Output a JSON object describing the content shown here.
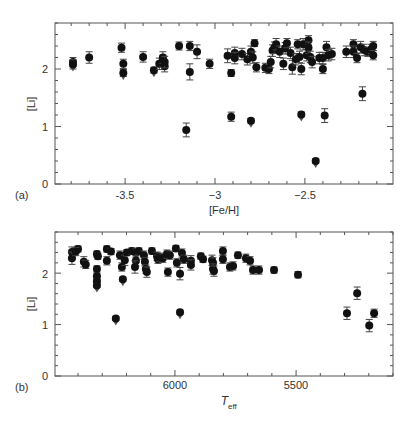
{
  "figure": {
    "panels": [
      {
        "label": "(a)",
        "xlabel": "[Fe/H]",
        "ylabel": "[Li]"
      },
      {
        "label": "(b)",
        "xlabel_main": "T",
        "xlabel_sub": "eff",
        "ylabel": "[Li]"
      }
    ]
  },
  "chart_data": [
    {
      "type": "scatter",
      "panel": "(a)",
      "title": "",
      "xlabel": "[Fe/H]",
      "ylabel": "[Li]",
      "xlim": [
        -3.89,
        -2.01
      ],
      "ylim": [
        0,
        2.8
      ],
      "xticks": [
        -3.5,
        -3,
        -2.5
      ],
      "xtick_labels": [
        "-3.5",
        "−3",
        "−2.5"
      ],
      "yticks": [
        0,
        1,
        2
      ],
      "ytick_labels": [
        "0",
        "1",
        "2"
      ],
      "grid": false,
      "legend": null,
      "marker": "filled-circle-with-errorbars",
      "upper_limit_marker": "downward-arrow",
      "points": [
        {
          "x": -3.79,
          "y": 2.12,
          "err": 0.08
        },
        {
          "x": -3.79,
          "y": 2.08,
          "err": 0.08,
          "upper_limit": true
        },
        {
          "x": -3.7,
          "y": 2.2,
          "err": 0.1
        },
        {
          "x": -3.52,
          "y": 2.37,
          "err": 0.08
        },
        {
          "x": -3.51,
          "y": 2.09,
          "err": 0.08
        },
        {
          "x": -3.51,
          "y": 1.93,
          "err": 0.06,
          "upper_limit": true
        },
        {
          "x": -3.4,
          "y": 2.21,
          "err": 0.09
        },
        {
          "x": -3.34,
          "y": 1.98,
          "err": 0.05,
          "upper_limit": true
        },
        {
          "x": -3.31,
          "y": 2.09,
          "err": 0.1
        },
        {
          "x": -3.29,
          "y": 2.14,
          "err": 0.1
        },
        {
          "x": -3.29,
          "y": 2.2,
          "err": 0.1
        },
        {
          "x": -3.28,
          "y": 2.05,
          "err": 0.1
        },
        {
          "x": -3.28,
          "y": 2.12,
          "err": 0.1
        },
        {
          "x": -3.2,
          "y": 2.4,
          "err": 0.07
        },
        {
          "x": -3.14,
          "y": 2.4,
          "err": 0.08
        },
        {
          "x": -3.14,
          "y": 1.95,
          "err": 0.14
        },
        {
          "x": -3.1,
          "y": 2.3,
          "err": 0.12
        },
        {
          "x": -3.16,
          "y": 0.94,
          "err": 0.12
        },
        {
          "x": -3.03,
          "y": 2.09,
          "err": 0.08
        },
        {
          "x": -2.93,
          "y": 2.23,
          "err": 0.12
        },
        {
          "x": -2.91,
          "y": 1.93,
          "err": 0.06
        },
        {
          "x": -2.89,
          "y": 2.28,
          "err": 0.1
        },
        {
          "x": -2.89,
          "y": 2.19,
          "err": 0.1
        },
        {
          "x": -2.85,
          "y": 2.26,
          "err": 0.1
        },
        {
          "x": -2.82,
          "y": 2.17,
          "err": 0.1
        },
        {
          "x": -2.8,
          "y": 2.3,
          "err": 0.1
        },
        {
          "x": -2.79,
          "y": 2.2,
          "err": 0.1
        },
        {
          "x": -2.78,
          "y": 2.45,
          "err": 0.06
        },
        {
          "x": -2.77,
          "y": 2.03,
          "err": 0.08
        },
        {
          "x": -2.72,
          "y": 2.02,
          "err": 0.08
        },
        {
          "x": -2.7,
          "y": 2.0,
          "err": 0.08
        },
        {
          "x": -2.69,
          "y": 2.12,
          "err": 0.1
        },
        {
          "x": -2.68,
          "y": 2.32,
          "err": 0.1
        },
        {
          "x": -2.67,
          "y": 2.37,
          "err": 0.1
        },
        {
          "x": -2.66,
          "y": 2.43,
          "err": 0.1
        },
        {
          "x": -2.64,
          "y": 2.3,
          "err": 0.1
        },
        {
          "x": -2.62,
          "y": 2.09,
          "err": 0.1
        },
        {
          "x": -2.61,
          "y": 2.36,
          "err": 0.1
        },
        {
          "x": -2.6,
          "y": 2.45,
          "err": 0.08
        },
        {
          "x": -2.58,
          "y": 2.28,
          "err": 0.1
        },
        {
          "x": -2.57,
          "y": 2.03,
          "err": 0.12
        },
        {
          "x": -2.55,
          "y": 2.17,
          "err": 0.1
        },
        {
          "x": -2.54,
          "y": 2.43,
          "err": 0.08
        },
        {
          "x": -2.53,
          "y": 2.21,
          "err": 0.1
        },
        {
          "x": -2.52,
          "y": 2.0,
          "err": 0.1
        },
        {
          "x": -2.51,
          "y": 2.43,
          "err": 0.1
        },
        {
          "x": -2.49,
          "y": 2.24,
          "err": 0.1
        },
        {
          "x": -2.48,
          "y": 2.5,
          "err": 0.08
        },
        {
          "x": -2.48,
          "y": 2.37,
          "err": 0.1
        },
        {
          "x": -2.47,
          "y": 2.21,
          "err": 0.1
        },
        {
          "x": -2.46,
          "y": 2.12,
          "err": 0.1
        },
        {
          "x": -2.42,
          "y": 2.19,
          "err": 0.1
        },
        {
          "x": -2.4,
          "y": 2.19,
          "err": 0.1
        },
        {
          "x": -2.4,
          "y": 2.0,
          "err": 0.08
        },
        {
          "x": -2.38,
          "y": 2.38,
          "err": 0.1
        },
        {
          "x": -2.37,
          "y": 2.24,
          "err": 0.1
        },
        {
          "x": -2.35,
          "y": 2.26,
          "err": 0.1
        },
        {
          "x": -2.27,
          "y": 2.3,
          "err": 0.1
        },
        {
          "x": -2.23,
          "y": 2.43,
          "err": 0.08
        },
        {
          "x": -2.23,
          "y": 2.3,
          "err": 0.1
        },
        {
          "x": -2.21,
          "y": 2.19,
          "err": 0.08
        },
        {
          "x": -2.19,
          "y": 2.38,
          "err": 0.1
        },
        {
          "x": -2.17,
          "y": 2.33,
          "err": 0.1
        },
        {
          "x": -2.15,
          "y": 2.3,
          "err": 0.08
        },
        {
          "x": -2.13,
          "y": 2.35,
          "err": 0.08
        },
        {
          "x": -2.12,
          "y": 2.4,
          "err": 0.08
        },
        {
          "x": -2.12,
          "y": 2.24,
          "err": 0.08
        },
        {
          "x": -2.91,
          "y": 1.17,
          "err": 0.08
        },
        {
          "x": -2.8,
          "y": 1.1,
          "err": 0.04,
          "upper_limit": true
        },
        {
          "x": -2.52,
          "y": 1.21,
          "err": 0.04,
          "upper_limit": true
        },
        {
          "x": -2.39,
          "y": 1.19,
          "err": 0.12
        },
        {
          "x": -2.44,
          "y": 0.4,
          "err": 0.04,
          "upper_limit": true
        },
        {
          "x": -2.18,
          "y": 1.57,
          "err": 0.12
        }
      ]
    },
    {
      "type": "scatter",
      "panel": "(b)",
      "title": "",
      "xlabel": "T_eff",
      "ylabel": "[Li]",
      "xlim": [
        6495,
        5100
      ],
      "ylim": [
        0,
        2.8
      ],
      "xticks": [
        6000,
        5500
      ],
      "xtick_labels": [
        "6000",
        "5500"
      ],
      "yticks": [
        0,
        1,
        2
      ],
      "ytick_labels": [
        "0",
        "1",
        "2"
      ],
      "grid": false,
      "legend": null,
      "marker": "filled-circle-with-errorbars",
      "upper_limit_marker": "downward-arrow",
      "points": [
        {
          "x": 6425,
          "y": 2.41,
          "err": 0.1
        },
        {
          "x": 6425,
          "y": 2.29,
          "err": 0.12
        },
        {
          "x": 6400,
          "y": 2.47,
          "err": 0.06
        },
        {
          "x": 6409,
          "y": 2.42,
          "err": 0.08
        },
        {
          "x": 6376,
          "y": 2.22,
          "err": 0.1
        },
        {
          "x": 6368,
          "y": 2.17,
          "err": 0.08
        },
        {
          "x": 6322,
          "y": 2.37,
          "err": 0.06
        },
        {
          "x": 6318,
          "y": 2.33,
          "err": 0.06
        },
        {
          "x": 6322,
          "y": 2.08,
          "err": 0.06
        },
        {
          "x": 6322,
          "y": 1.94,
          "err": 0.06
        },
        {
          "x": 6322,
          "y": 1.84,
          "err": 0.06
        },
        {
          "x": 6322,
          "y": 1.76,
          "err": 0.04,
          "upper_limit": true
        },
        {
          "x": 6281,
          "y": 2.24,
          "err": 0.08
        },
        {
          "x": 6281,
          "y": 2.47,
          "err": 0.06
        },
        {
          "x": 6264,
          "y": 2.42,
          "err": 0.06
        },
        {
          "x": 6244,
          "y": 1.12,
          "err": 0.04,
          "upper_limit": true
        },
        {
          "x": 6227,
          "y": 2.35,
          "err": 0.08
        },
        {
          "x": 6219,
          "y": 2.12,
          "err": 0.08
        },
        {
          "x": 6215,
          "y": 1.88,
          "err": 0.04,
          "upper_limit": true
        },
        {
          "x": 6207,
          "y": 2.25,
          "err": 0.1
        },
        {
          "x": 6198,
          "y": 2.4,
          "err": 0.06
        },
        {
          "x": 6178,
          "y": 2.43,
          "err": 0.06
        },
        {
          "x": 6161,
          "y": 2.39,
          "err": 0.08
        },
        {
          "x": 6161,
          "y": 2.24,
          "err": 0.1
        },
        {
          "x": 6165,
          "y": 2.12,
          "err": 0.12
        },
        {
          "x": 6149,
          "y": 2.43,
          "err": 0.06
        },
        {
          "x": 6128,
          "y": 2.35,
          "err": 0.08
        },
        {
          "x": 6124,
          "y": 2.22,
          "err": 0.08
        },
        {
          "x": 6120,
          "y": 2.08,
          "err": 0.08
        },
        {
          "x": 6116,
          "y": 2.02,
          "err": 0.1
        },
        {
          "x": 6095,
          "y": 2.43,
          "err": 0.06
        },
        {
          "x": 6074,
          "y": 2.33,
          "err": 0.08
        },
        {
          "x": 6070,
          "y": 2.27,
          "err": 0.08
        },
        {
          "x": 6062,
          "y": 2.31,
          "err": 0.08
        },
        {
          "x": 6050,
          "y": 2.29,
          "err": 0.08
        },
        {
          "x": 6033,
          "y": 2.37,
          "err": 0.08
        },
        {
          "x": 6029,
          "y": 2.02,
          "err": 0.08
        },
        {
          "x": 6021,
          "y": 2.35,
          "err": 0.08
        },
        {
          "x": 5996,
          "y": 2.48,
          "err": 0.06
        },
        {
          "x": 5992,
          "y": 2.2,
          "err": 0.08
        },
        {
          "x": 5979,
          "y": 1.99,
          "err": 0.12
        },
        {
          "x": 5979,
          "y": 1.24,
          "err": 0.04,
          "upper_limit": true
        },
        {
          "x": 5971,
          "y": 2.39,
          "err": 0.08
        },
        {
          "x": 5963,
          "y": 2.27,
          "err": 0.08
        },
        {
          "x": 5934,
          "y": 2.24,
          "err": 0.1
        },
        {
          "x": 5934,
          "y": 2.16,
          "err": 0.1
        },
        {
          "x": 5893,
          "y": 2.33,
          "err": 0.06
        },
        {
          "x": 5884,
          "y": 2.27,
          "err": 0.06
        },
        {
          "x": 5847,
          "y": 2.25,
          "err": 0.1
        },
        {
          "x": 5843,
          "y": 2.2,
          "err": 0.1
        },
        {
          "x": 5843,
          "y": 2.08,
          "err": 0.1
        },
        {
          "x": 5839,
          "y": 2.04,
          "err": 0.1
        },
        {
          "x": 5802,
          "y": 2.43,
          "err": 0.08
        },
        {
          "x": 5802,
          "y": 2.27,
          "err": 0.08
        },
        {
          "x": 5773,
          "y": 2.12,
          "err": 0.08
        },
        {
          "x": 5760,
          "y": 2.14,
          "err": 0.08
        },
        {
          "x": 5740,
          "y": 2.35,
          "err": 0.06
        },
        {
          "x": 5707,
          "y": 2.29,
          "err": 0.08
        },
        {
          "x": 5690,
          "y": 2.24,
          "err": 0.08
        },
        {
          "x": 5678,
          "y": 2.06,
          "err": 0.08
        },
        {
          "x": 5653,
          "y": 2.06,
          "err": 0.08
        },
        {
          "x": 5591,
          "y": 2.06,
          "err": 0.06
        },
        {
          "x": 5492,
          "y": 1.97,
          "err": 0.06
        },
        {
          "x": 5290,
          "y": 1.22,
          "err": 0.12
        },
        {
          "x": 5248,
          "y": 1.61,
          "err": 0.12
        },
        {
          "x": 5198,
          "y": 0.98,
          "err": 0.12
        },
        {
          "x": 5178,
          "y": 1.22,
          "err": 0.08
        }
      ]
    }
  ],
  "style": {
    "marker_color": "#111111",
    "axis_color": "#555555",
    "text_color": "#333333"
  }
}
